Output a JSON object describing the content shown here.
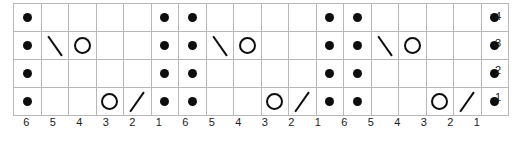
{
  "chart_data": {
    "type": "table",
    "title": "",
    "xlabel": "",
    "ylabel": "",
    "grid": true,
    "legend_position": "none",
    "rows": 4,
    "columns": 18,
    "row_labels": [
      "4",
      "3",
      "2",
      "1"
    ],
    "column_labels": [
      "6",
      "5",
      "4",
      "3",
      "2",
      "1",
      "6",
      "5",
      "4",
      "3",
      "2",
      "1",
      "6",
      "5",
      "4",
      "3",
      "2",
      "1"
    ],
    "symbol_names": {
      "dot": "purl-dot-symbol",
      "circle": "yarn-over-circle-symbol",
      "backslash": "left-decrease-backslash-symbol",
      "slash": "right-decrease-slash-symbol",
      "empty": "empty-cell"
    },
    "colors": {
      "symbol": "#0d0d0d",
      "gridline": "#b8b8b8",
      "background": "#ffffff",
      "label_text": "#1a1a1a"
    },
    "cells": [
      [
        "dot",
        "empty",
        "empty",
        "empty",
        "empty",
        "dot",
        "dot",
        "empty",
        "empty",
        "empty",
        "empty",
        "dot",
        "dot",
        "empty",
        "empty",
        "empty",
        "empty",
        "dot"
      ],
      [
        "dot",
        "backslash",
        "circle",
        "empty",
        "empty",
        "dot",
        "dot",
        "backslash",
        "circle",
        "empty",
        "empty",
        "dot",
        "dot",
        "backslash",
        "circle",
        "empty",
        "empty",
        "dot"
      ],
      [
        "dot",
        "empty",
        "empty",
        "empty",
        "empty",
        "dot",
        "dot",
        "empty",
        "empty",
        "empty",
        "empty",
        "dot",
        "dot",
        "empty",
        "empty",
        "empty",
        "empty",
        "dot"
      ],
      [
        "dot",
        "empty",
        "empty",
        "circle",
        "slash",
        "dot",
        "dot",
        "empty",
        "empty",
        "circle",
        "slash",
        "dot",
        "dot",
        "empty",
        "empty",
        "circle",
        "slash",
        "dot"
      ]
    ]
  }
}
